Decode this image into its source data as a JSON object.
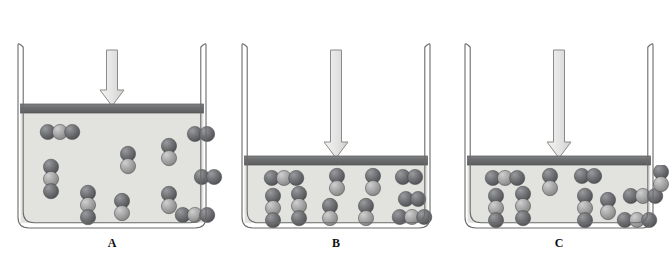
{
  "figure": {
    "colors": {
      "oxygen_sphere": "#6f7073",
      "carbon_sphere": "#a9a9a9",
      "gas_fill": "#e2e2df",
      "piston_bar": "#6e6f71",
      "vessel_wall": "#f2f2f0",
      "vessel_outline": "#6b6b6b",
      "arrow_fill": "#e6e6e4",
      "arrow_outline": "#8a8a8a",
      "text": "#18181a"
    }
  },
  "panels": [
    {
      "id": "A",
      "label": "A",
      "equation": {
        "reactants": "2CO",
        "reactants_sub": "2",
        "products_left": "2CO",
        "products_plus": "+",
        "products_right": "O",
        "products_sub": "2",
        "arrow_type": "equilibrium-balanced",
        "forward_length": 30,
        "reverse_length": 30
      },
      "piston": {
        "y": 104,
        "state": "raised",
        "gas_height": 112
      },
      "pressure_arrow": {
        "label": "applied-pressure",
        "tip_y": 104
      },
      "molecule_counts": {
        "CO2": 6,
        "CO": 5,
        "O2": 3
      },
      "molecules": [
        {
          "type": "CO2",
          "x": 42,
          "y": 132,
          "orient": "h"
        },
        {
          "type": "CO2",
          "x": 33,
          "y": 179,
          "orient": "v"
        },
        {
          "type": "CO2",
          "x": 70,
          "y": 205,
          "orient": "v"
        },
        {
          "type": "CO",
          "x": 110,
          "y": 160,
          "orient": "v"
        },
        {
          "type": "CO",
          "x": 151,
          "y": 152,
          "orient": "v"
        },
        {
          "type": "CO",
          "x": 151,
          "y": 200,
          "orient": "v"
        },
        {
          "type": "CO2",
          "x": 177,
          "y": 215,
          "orient": "h"
        },
        {
          "type": "O2",
          "x": 183,
          "y": 134,
          "orient": "h"
        },
        {
          "type": "O2",
          "x": 190,
          "y": 177,
          "orient": "h"
        },
        {
          "type": "CO",
          "x": 104,
          "y": 207,
          "orient": "v"
        }
      ]
    },
    {
      "id": "B",
      "label": "B",
      "equation": {
        "reactants": "2CO",
        "reactants_sub": "2",
        "products_left": "2CO",
        "products_plus": "+",
        "products_right": "O",
        "products_sub": "2",
        "arrow_type": "equilibrium-shifted-left",
        "forward_length": 24,
        "reverse_length": 34
      },
      "piston": {
        "y": 156,
        "state": "lowered",
        "gas_height": 60
      },
      "pressure_arrow": {
        "label": "applied-pressure",
        "tip_y": 156
      },
      "molecule_counts": {
        "CO2": 6,
        "CO": 5,
        "O2": 3
      },
      "molecules": [
        {
          "type": "CO2",
          "x": 42,
          "y": 178,
          "orient": "h"
        },
        {
          "type": "CO2",
          "x": 31,
          "y": 208,
          "orient": "v"
        },
        {
          "type": "CO2",
          "x": 57,
          "y": 206,
          "orient": "v"
        },
        {
          "type": "CO",
          "x": 95,
          "y": 182,
          "orient": "v"
        },
        {
          "type": "CO",
          "x": 88,
          "y": 212,
          "orient": "v"
        },
        {
          "type": "CO",
          "x": 131,
          "y": 182,
          "orient": "v"
        },
        {
          "type": "CO",
          "x": 124,
          "y": 212,
          "orient": "v"
        },
        {
          "type": "O2",
          "x": 167,
          "y": 177,
          "orient": "h"
        },
        {
          "type": "O2",
          "x": 170,
          "y": 199,
          "orient": "h"
        },
        {
          "type": "CO2",
          "x": 170,
          "y": 217,
          "orient": "h"
        }
      ]
    },
    {
      "id": "C",
      "label": "C",
      "equation": {
        "reactants": "2CO",
        "reactants_sub": "2",
        "products_left": "2CO",
        "products_plus": "+",
        "products_right": "O",
        "products_sub": "2",
        "arrow_type": "equilibrium-balanced",
        "forward_length": 30,
        "reverse_length": 30
      },
      "piston": {
        "y": 156,
        "state": "lowered",
        "gas_height": 60
      },
      "pressure_arrow": {
        "label": "applied-pressure",
        "tip_y": 156
      },
      "molecule_counts": {
        "CO2": 6,
        "CO": 4,
        "O2": 3
      },
      "molecules": [
        {
          "type": "CO2",
          "x": 40,
          "y": 178,
          "orient": "h"
        },
        {
          "type": "CO2",
          "x": 31,
          "y": 208,
          "orient": "v"
        },
        {
          "type": "CO2",
          "x": 58,
          "y": 206,
          "orient": "v"
        },
        {
          "type": "CO",
          "x": 85,
          "y": 182,
          "orient": "v"
        },
        {
          "type": "CO2",
          "x": 120,
          "y": 208,
          "orient": "v"
        },
        {
          "type": "CO",
          "x": 143,
          "y": 206,
          "orient": "v"
        },
        {
          "type": "O2",
          "x": 123,
          "y": 176,
          "orient": "h"
        },
        {
          "type": "CO2",
          "x": 178,
          "y": 196,
          "orient": "h"
        },
        {
          "type": "CO2",
          "x": 172,
          "y": 220,
          "orient": "h"
        },
        {
          "type": "CO",
          "x": 196,
          "y": 178,
          "orient": "v"
        }
      ]
    }
  ]
}
